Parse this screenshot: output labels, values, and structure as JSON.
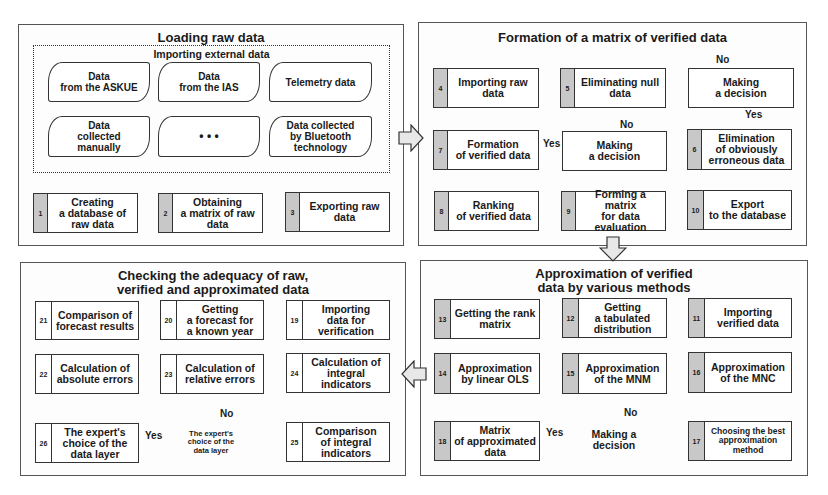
{
  "panels": {
    "loading": {
      "title": "Loading raw data",
      "import_group": {
        "title": "Importing external data",
        "sources": [
          {
            "label": "Data\nfrom the ASKUE"
          },
          {
            "label": "Data\nfrom the IAS"
          },
          {
            "label": "Telemetry data"
          },
          {
            "label": "Data\ncollected\nmanually"
          },
          {
            "label": "• • •"
          },
          {
            "label": "Data collected\nby Bluetooth\ntechnology"
          }
        ]
      },
      "steps": [
        {
          "num": "1",
          "label": "Creating\na database of\nraw data"
        },
        {
          "num": "2",
          "label": "Obtaining\na matrix of raw\ndata"
        },
        {
          "num": "3",
          "label": "Exporting raw\ndata"
        }
      ]
    },
    "verified": {
      "title": "Formation of a matrix of verified data",
      "steps": [
        {
          "num": "4",
          "label": "Importing raw\ndata"
        },
        {
          "num": "5",
          "label": "Eliminating null\ndata"
        },
        {
          "num": "6",
          "label": "Elimination\nof obviously\nerroneous data"
        },
        {
          "num": "7",
          "label": "Formation\nof verified data"
        },
        {
          "num": "8",
          "label": "Ranking\nof verified data"
        },
        {
          "num": "9",
          "label": "Forming a matrix\nfor data\nevaluation"
        },
        {
          "num": "10",
          "label": "Export\nto the database"
        }
      ],
      "decisions": [
        {
          "label": "Making\na decision"
        },
        {
          "label": "Making\na decision"
        }
      ],
      "tags": {
        "no1": "No",
        "yes1": "Yes",
        "no2": "No",
        "yes2": "Yes"
      }
    },
    "approximation": {
      "title": "Approximation of verified\ndata by various methods",
      "steps": [
        {
          "num": "11",
          "label": "Importing\nverified data"
        },
        {
          "num": "12",
          "label": "Getting\na tabulated\ndistribution"
        },
        {
          "num": "13",
          "label": "Getting the rank\nmatrix"
        },
        {
          "num": "14",
          "label": "Approximation\nby linear OLS"
        },
        {
          "num": "15",
          "label": "Approximation\nof the MNM"
        },
        {
          "num": "16",
          "label": "Approximation\nof the MNC"
        },
        {
          "num": "17",
          "label": "Choosing the best\napproximation\nmethod"
        },
        {
          "num": "18",
          "label": "Matrix\nof approximated\ndata"
        }
      ],
      "decision": {
        "label": "Making a\ndecision"
      },
      "tags": {
        "no": "No",
        "yes": "Yes"
      }
    },
    "adequacy": {
      "title": "Checking the adequacy of raw,\nverified and approximated data",
      "steps": [
        {
          "num": "19",
          "label": "Importing\ndata for\nverification"
        },
        {
          "num": "20",
          "label": "Getting\na forecast for\na known year"
        },
        {
          "num": "21",
          "label": "Comparison of\nforecast results"
        },
        {
          "num": "22",
          "label": "Calculation of\nabsolute errors"
        },
        {
          "num": "23",
          "label": "Calculation of\nrelative errors"
        },
        {
          "num": "24",
          "label": "Calculation of\nintegral\nindicators"
        },
        {
          "num": "25",
          "label": "Comparison\nof integral\nindicators"
        },
        {
          "num": "26",
          "label": "The expert's\nchoice of the\ndata layer"
        }
      ],
      "decision": {
        "label": "The expert's\nchoice of the\ndata layer"
      },
      "tags": {
        "no": "No",
        "yes": "Yes"
      }
    }
  },
  "colors": {
    "number_cell": "#c8c8c8",
    "border": "#333333",
    "transition_arrow_fill": "#e8e8e8"
  }
}
